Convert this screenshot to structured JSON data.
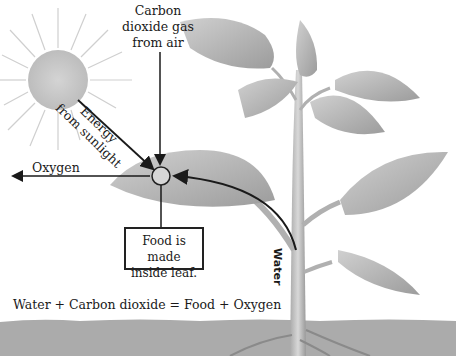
{
  "diagram": {
    "labels": {
      "carbon_dioxide": "Carbon dioxide gas from air",
      "carbon_dioxide_lines": [
        "Carbon",
        "dioxide gas",
        "from air"
      ],
      "energy_lines": [
        "Energy",
        "from sunlight"
      ],
      "oxygen": "Oxygen",
      "food_lines": [
        "Food is made",
        "inside leaf."
      ],
      "water": "Water",
      "equation": "Water + Carbon dioxide = Food + Oxygen"
    },
    "colors": {
      "sun": "#c8c8c8",
      "leaf": "#b5b5b5",
      "soil": "#a9a9a9",
      "arrow": "#1a1a1a",
      "background": "#ffffff"
    }
  }
}
